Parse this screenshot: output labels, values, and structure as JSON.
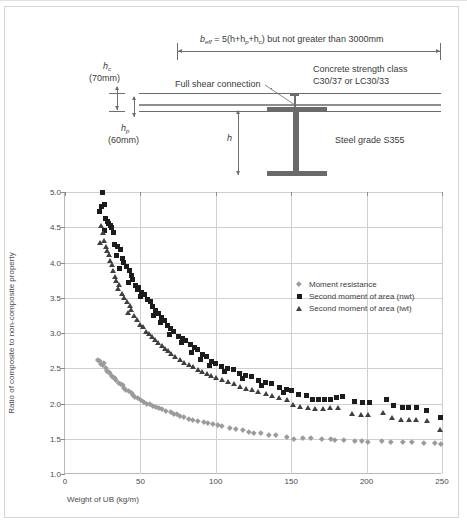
{
  "diagram": {
    "beff_formula": "b",
    "beff_sub": "eff",
    "beff_rest": " = 5(h+h",
    "beff_sub2": "p",
    "beff_rest2": "+h",
    "beff_sub3": "c",
    "beff_rest3": ") but not greater than 3000mm",
    "hc_symbol": "h",
    "hc_sub": "c",
    "hc_value": "(70mm)",
    "hp_symbol": "h",
    "hp_sub": "p",
    "hp_value": "(60mm)",
    "h_symbol": "h",
    "shear_label": "Full shear connection",
    "concrete_line1": "Concrete strength class",
    "concrete_line2": "C30/37 or LC30/33",
    "steel_label": "Steel grade S355"
  },
  "chart_data": {
    "type": "scatter",
    "title": "",
    "xlabel": "Weight of UB (kg/m)",
    "ylabel": "Ratio of composite to non-composite property",
    "xlim": [
      0,
      250
    ],
    "ylim": [
      1.0,
      5.0
    ],
    "xticks": [
      0,
      50,
      100,
      150,
      200,
      250
    ],
    "ytick_labels": [
      "1.0",
      "1.5",
      "2.0",
      "2.5",
      "3.0",
      "3.5",
      "4.0",
      "4.5",
      "5.0"
    ],
    "yticks": [
      1.0,
      1.5,
      2.0,
      2.5,
      3.0,
      3.5,
      4.0,
      4.5,
      5.0
    ],
    "grid": true,
    "legend_position": "upper-right-inside",
    "series": [
      {
        "name": "Moment resistance",
        "marker": "diamond",
        "color": "#9b9b9b",
        "points": [
          [
            22,
            2.62
          ],
          [
            23,
            2.6
          ],
          [
            24,
            2.57
          ],
          [
            25,
            2.55
          ],
          [
            26,
            2.58
          ],
          [
            27,
            2.5
          ],
          [
            28,
            2.47
          ],
          [
            29,
            2.45
          ],
          [
            30,
            2.43
          ],
          [
            31,
            2.4
          ],
          [
            32,
            2.38
          ],
          [
            33,
            2.36
          ],
          [
            34,
            2.33
          ],
          [
            36,
            2.3
          ],
          [
            37,
            2.28
          ],
          [
            38,
            2.26
          ],
          [
            39,
            2.22
          ],
          [
            40,
            2.2
          ],
          [
            42,
            2.18
          ],
          [
            44,
            2.15
          ],
          [
            45,
            2.13
          ],
          [
            46,
            2.1
          ],
          [
            48,
            2.08
          ],
          [
            50,
            2.05
          ],
          [
            52,
            2.03
          ],
          [
            54,
            2.0
          ],
          [
            56,
            1.99
          ],
          [
            58,
            1.97
          ],
          [
            60,
            1.95
          ],
          [
            62,
            1.94
          ],
          [
            64,
            1.92
          ],
          [
            67,
            1.9
          ],
          [
            70,
            1.88
          ],
          [
            72,
            1.86
          ],
          [
            74,
            1.85
          ],
          [
            76,
            1.83
          ],
          [
            79,
            1.81
          ],
          [
            82,
            1.79
          ],
          [
            85,
            1.77
          ],
          [
            88,
            1.76
          ],
          [
            92,
            1.74
          ],
          [
            95,
            1.72
          ],
          [
            98,
            1.71
          ],
          [
            101,
            1.7
          ],
          [
            104,
            1.68
          ],
          [
            109,
            1.66
          ],
          [
            113,
            1.64
          ],
          [
            118,
            1.62
          ],
          [
            122,
            1.6
          ],
          [
            125,
            1.59
          ],
          [
            130,
            1.58
          ],
          [
            135,
            1.56
          ],
          [
            140,
            1.55
          ],
          [
            147,
            1.53
          ],
          [
            152,
            1.5
          ],
          [
            158,
            1.52
          ],
          [
            163,
            1.51
          ],
          [
            170,
            1.5
          ],
          [
            176,
            1.5
          ],
          [
            179,
            1.49
          ],
          [
            185,
            1.48
          ],
          [
            192,
            1.47
          ],
          [
            197,
            1.47
          ],
          [
            201,
            1.46
          ],
          [
            210,
            1.47
          ],
          [
            216,
            1.46
          ],
          [
            224,
            1.45
          ],
          [
            230,
            1.45
          ],
          [
            238,
            1.44
          ],
          [
            245,
            1.44
          ],
          [
            249,
            1.43
          ]
        ]
      },
      {
        "name": "Second moment of area (nwt)",
        "marker": "square",
        "color": "#1c1c1c",
        "points": [
          [
            25,
            5.0
          ],
          [
            24,
            4.8
          ],
          [
            26,
            4.82
          ],
          [
            23,
            4.72
          ],
          [
            27,
            4.62
          ],
          [
            28,
            4.58
          ],
          [
            29,
            4.55
          ],
          [
            30,
            4.52
          ],
          [
            31,
            4.5
          ],
          [
            26,
            4.45
          ],
          [
            32,
            4.42
          ],
          [
            33,
            4.25
          ],
          [
            35,
            4.22
          ],
          [
            37,
            4.18
          ],
          [
            34,
            4.1
          ],
          [
            38,
            4.05
          ],
          [
            39,
            4.0
          ],
          [
            41,
            3.95
          ],
          [
            36,
            3.92
          ],
          [
            43,
            3.88
          ],
          [
            44,
            3.82
          ],
          [
            45,
            3.76
          ],
          [
            42,
            3.72
          ],
          [
            47,
            3.68
          ],
          [
            49,
            3.65
          ],
          [
            48,
            3.62
          ],
          [
            51,
            3.58
          ],
          [
            53,
            3.55
          ],
          [
            50,
            3.52
          ],
          [
            55,
            3.48
          ],
          [
            57,
            3.45
          ],
          [
            58,
            3.38
          ],
          [
            60,
            3.32
          ],
          [
            62,
            3.28
          ],
          [
            59,
            3.25
          ],
          [
            64,
            3.22
          ],
          [
            66,
            3.18
          ],
          [
            63,
            3.15
          ],
          [
            68,
            3.1
          ],
          [
            70,
            3.06
          ],
          [
            72,
            3.02
          ],
          [
            69,
            2.98
          ],
          [
            75,
            2.95
          ],
          [
            78,
            2.92
          ],
          [
            80,
            2.9
          ],
          [
            77,
            2.86
          ],
          [
            83,
            2.83
          ],
          [
            86,
            2.8
          ],
          [
            88,
            2.76
          ],
          [
            84,
            2.73
          ],
          [
            91,
            2.7
          ],
          [
            94,
            2.66
          ],
          [
            90,
            2.63
          ],
          [
            97,
            2.6
          ],
          [
            100,
            2.57
          ],
          [
            96,
            2.54
          ],
          [
            104,
            2.52
          ],
          [
            108,
            2.5
          ],
          [
            112,
            2.48
          ],
          [
            106,
            2.45
          ],
          [
            116,
            2.43
          ],
          [
            120,
            2.4
          ],
          [
            124,
            2.38
          ],
          [
            118,
            2.35
          ],
          [
            128,
            2.33
          ],
          [
            133,
            2.3
          ],
          [
            137,
            2.28
          ],
          [
            130,
            2.25
          ],
          [
            142,
            2.22
          ],
          [
            147,
            2.2
          ],
          [
            150,
            2.18
          ],
          [
            145,
            2.16
          ],
          [
            155,
            2.13
          ],
          [
            160,
            2.11
          ],
          [
            164,
            2.06
          ],
          [
            168,
            2.05
          ],
          [
            172,
            2.05
          ],
          [
            176,
            2.06
          ],
          [
            180,
            2.08
          ],
          [
            184,
            2.1
          ],
          [
            192,
            2.03
          ],
          [
            197,
            2.02
          ],
          [
            202,
            2.01
          ],
          [
            213,
            2.06
          ],
          [
            218,
            1.97
          ],
          [
            224,
            1.95
          ],
          [
            228,
            1.94
          ],
          [
            233,
            1.94
          ],
          [
            240,
            1.9
          ],
          [
            249,
            1.8
          ]
        ]
      },
      {
        "name": "Second moment of area (lwt)",
        "marker": "triangle",
        "color": "#3f3f3f",
        "points": [
          [
            24,
            4.52
          ],
          [
            25,
            4.42
          ],
          [
            26,
            4.3
          ],
          [
            23,
            4.28
          ],
          [
            27,
            4.22
          ],
          [
            28,
            4.16
          ],
          [
            29,
            4.1
          ],
          [
            30,
            4.02
          ],
          [
            31,
            3.96
          ],
          [
            32,
            3.88
          ],
          [
            33,
            3.8
          ],
          [
            34,
            3.74
          ],
          [
            36,
            3.68
          ],
          [
            35,
            3.62
          ],
          [
            38,
            3.56
          ],
          [
            39,
            3.5
          ],
          [
            41,
            3.44
          ],
          [
            43,
            3.38
          ],
          [
            44,
            3.32
          ],
          [
            42,
            3.28
          ],
          [
            46,
            3.24
          ],
          [
            48,
            3.18
          ],
          [
            50,
            3.12
          ],
          [
            52,
            3.08
          ],
          [
            54,
            3.02
          ],
          [
            56,
            2.98
          ],
          [
            58,
            2.94
          ],
          [
            60,
            2.9
          ],
          [
            62,
            2.86
          ],
          [
            64,
            2.82
          ],
          [
            66,
            2.78
          ],
          [
            68,
            2.74
          ],
          [
            70,
            2.7
          ],
          [
            73,
            2.66
          ],
          [
            76,
            2.62
          ],
          [
            79,
            2.58
          ],
          [
            82,
            2.55
          ],
          [
            85,
            2.52
          ],
          [
            88,
            2.48
          ],
          [
            91,
            2.45
          ],
          [
            94,
            2.42
          ],
          [
            97,
            2.39
          ],
          [
            100,
            2.36
          ],
          [
            104,
            2.33
          ],
          [
            108,
            2.3
          ],
          [
            112,
            2.27
          ],
          [
            116,
            2.24
          ],
          [
            120,
            2.21
          ],
          [
            124,
            2.19
          ],
          [
            128,
            2.16
          ],
          [
            133,
            2.13
          ],
          [
            137,
            2.11
          ],
          [
            142,
            2.08
          ],
          [
            147,
            2.05
          ],
          [
            151,
            1.98
          ],
          [
            156,
            1.95
          ],
          [
            161,
            1.93
          ],
          [
            166,
            1.92
          ],
          [
            171,
            1.92
          ],
          [
            176,
            1.93
          ],
          [
            181,
            1.94
          ],
          [
            190,
            1.85
          ],
          [
            196,
            1.84
          ],
          [
            201,
            1.83
          ],
          [
            211,
            1.86
          ],
          [
            217,
            1.79
          ],
          [
            223,
            1.77
          ],
          [
            228,
            1.77
          ],
          [
            233,
            1.76
          ],
          [
            240,
            1.75
          ],
          [
            249,
            1.62
          ]
        ]
      }
    ]
  }
}
